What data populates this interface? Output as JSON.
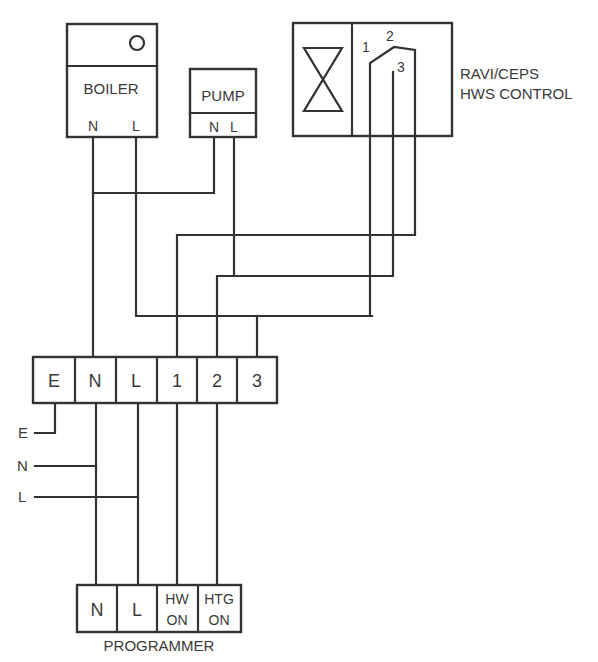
{
  "diagram": {
    "type": "wiring diagram",
    "colors": {
      "line": "#333333",
      "text": "#3a3a3a",
      "background": "#ffffff"
    },
    "boiler": {
      "label": "BOILER",
      "indicator_icon": "circle-icon",
      "terminals": [
        "N",
        "L"
      ]
    },
    "pump": {
      "label": "PUMP",
      "terminals": [
        "N",
        "L"
      ]
    },
    "hws_control": {
      "label_line1": "RAVI/CEPS",
      "label_line2": "HWS CONTROL",
      "valve_icon": "valve-icon",
      "switch_terminals": [
        "1",
        "2",
        "3"
      ]
    },
    "terminal_block": {
      "terminals": [
        "E",
        "N",
        "L",
        "1",
        "2",
        "3"
      ]
    },
    "supply": {
      "labels": [
        "E",
        "N",
        "L"
      ]
    },
    "programmer": {
      "label": "PROGRAMMER",
      "terminals": [
        {
          "line1": "N",
          "line2": ""
        },
        {
          "line1": "L",
          "line2": ""
        },
        {
          "line1": "HW",
          "line2": "ON"
        },
        {
          "line1": "HTG",
          "line2": "ON"
        }
      ]
    },
    "connections": [
      {
        "from": "Boiler N",
        "to": "Terminal block N"
      },
      {
        "from": "Pump N",
        "to": "Terminal block N"
      },
      {
        "from": "Boiler L",
        "to": "Terminal block 3"
      },
      {
        "from": "HWS control 1",
        "to": "Terminal block 3"
      },
      {
        "from": "Pump L",
        "to": "Terminal block 2"
      },
      {
        "from": "HWS control 3",
        "to": "Terminal block 2"
      },
      {
        "from": "HWS control 2",
        "to": "Terminal block 1"
      },
      {
        "from": "Supply E",
        "to": "Terminal block E"
      },
      {
        "from": "Supply N",
        "to": "Terminal block N"
      },
      {
        "from": "Supply L",
        "to": "Terminal block L"
      },
      {
        "from": "Terminal block N",
        "to": "Programmer N"
      },
      {
        "from": "Terminal block L",
        "to": "Programmer L"
      },
      {
        "from": "Terminal block 1",
        "to": "Programmer HW ON"
      },
      {
        "from": "Terminal block 2",
        "to": "Programmer HTG ON"
      }
    ]
  }
}
